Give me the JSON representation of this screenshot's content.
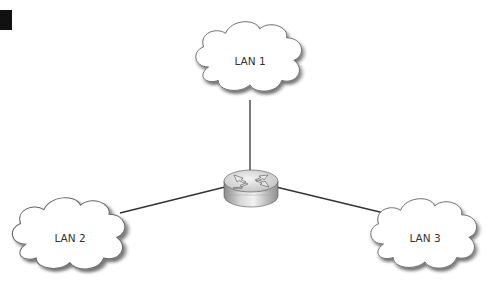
{
  "diagram": {
    "type": "network-topology",
    "hub": {
      "kind": "router",
      "label": ""
    },
    "nodes": [
      {
        "id": "lan1",
        "label": "LAN 1"
      },
      {
        "id": "lan2",
        "label": "LAN 2"
      },
      {
        "id": "lan3",
        "label": "LAN 3"
      }
    ],
    "edges": [
      {
        "from": "router",
        "to": "lan1"
      },
      {
        "from": "router",
        "to": "lan2"
      },
      {
        "from": "router",
        "to": "lan3"
      }
    ],
    "colors": {
      "background": "#ffffff",
      "line": "#333333",
      "cloud_fill": "#ffffff",
      "cloud_stroke": "#666666",
      "marker": "#111111"
    }
  }
}
